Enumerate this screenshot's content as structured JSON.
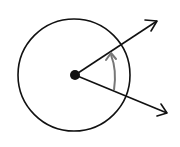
{
  "diagram": {
    "type": "angle-in-circle",
    "background": "#ffffff",
    "stroke_color": "#111111",
    "arc_color": "#777777",
    "circle": {
      "cx": 74,
      "cy": 75,
      "r": 56
    },
    "vertex": {
      "cx": 75,
      "cy": 75,
      "r": 5
    },
    "rays": [
      {
        "name": "terminal-ray",
        "x2": 157,
        "y2": 20
      },
      {
        "name": "initial-ray",
        "x2": 168,
        "y2": 112
      }
    ],
    "rotation_arc": {
      "direction": "counterclockwise",
      "from": [
        113,
        90
      ],
      "to": [
        111,
        53
      ]
    }
  }
}
